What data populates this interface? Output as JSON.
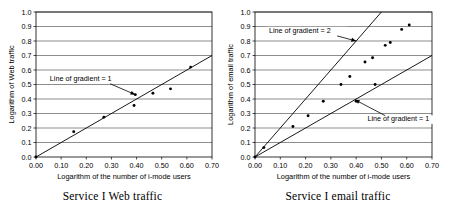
{
  "figure": {
    "panels": [
      {
        "id": "left",
        "caption": "Service I Web traffic",
        "chart_data": {
          "type": "scatter",
          "title": "Service I Web traffic",
          "xlabel": "Logarithm of the number of i-mode users",
          "ylabel": "Logarithm of Web traffic",
          "xlim": [
            0.0,
            0.7
          ],
          "ylim": [
            0.0,
            1.0
          ],
          "xticks": [
            "0.00",
            "0.10",
            "0.20",
            "0.30",
            "0.40",
            "0.50",
            "0.60",
            "0.70"
          ],
          "xtick_values": [
            0.0,
            0.1,
            0.2,
            0.3,
            0.4,
            0.5,
            0.6,
            0.7
          ],
          "yticks": [
            "0.0",
            "0.1",
            "0.2",
            "0.3",
            "0.4",
            "0.5",
            "0.6",
            "0.7",
            "0.8",
            "0.9",
            "1.0"
          ],
          "ytick_values": [
            0.0,
            0.1,
            0.2,
            0.3,
            0.4,
            0.5,
            0.6,
            0.7,
            0.8,
            0.9,
            1.0
          ],
          "grid": "horizontal",
          "legend": "none",
          "points": [
            {
              "x": 0.0,
              "y": 0.0
            },
            {
              "x": 0.15,
              "y": 0.175
            },
            {
              "x": 0.27,
              "y": 0.275
            },
            {
              "x": 0.39,
              "y": 0.355
            },
            {
              "x": 0.395,
              "y": 0.43
            },
            {
              "x": 0.465,
              "y": 0.44
            },
            {
              "x": 0.535,
              "y": 0.47
            },
            {
              "x": 0.615,
              "y": 0.62
            }
          ],
          "lines": [
            {
              "name": "Line of gradient = 1",
              "gradient": 1,
              "from": [
                0.0,
                0.0
              ],
              "to": [
                0.7,
                0.7
              ]
            }
          ],
          "annotations": [
            {
              "text": "Line of gradient = 1",
              "points_to": [
                0.395,
                0.43
              ]
            }
          ]
        }
      },
      {
        "id": "right",
        "caption": "Service I email traffic",
        "chart_data": {
          "type": "scatter",
          "title": "Service I email traffic",
          "xlabel": "Logarithm of the number of i-mode users",
          "ylabel": "Logarithm of email traffic",
          "xlim": [
            0.0,
            0.7
          ],
          "ylim": [
            0.0,
            1.0
          ],
          "xticks": [
            "0.00",
            "0.10",
            "0.20",
            "0.30",
            "0.40",
            "0.50",
            "0.60",
            "0.70"
          ],
          "xtick_values": [
            0.0,
            0.1,
            0.2,
            0.3,
            0.4,
            0.5,
            0.6,
            0.7
          ],
          "yticks": [
            "0.0",
            "0.1",
            "0.2",
            "0.3",
            "0.4",
            "0.5",
            "0.6",
            "0.7",
            "0.8",
            "0.9",
            "1.0"
          ],
          "ytick_values": [
            0.0,
            0.1,
            0.2,
            0.3,
            0.4,
            0.5,
            0.6,
            0.7,
            0.8,
            0.9,
            1.0
          ],
          "grid": "horizontal",
          "legend": "none",
          "points": [
            {
              "x": 0.0,
              "y": 0.0
            },
            {
              "x": 0.035,
              "y": 0.065
            },
            {
              "x": 0.15,
              "y": 0.21
            },
            {
              "x": 0.21,
              "y": 0.285
            },
            {
              "x": 0.27,
              "y": 0.385
            },
            {
              "x": 0.34,
              "y": 0.5
            },
            {
              "x": 0.375,
              "y": 0.555
            },
            {
              "x": 0.4,
              "y": 0.385
            },
            {
              "x": 0.435,
              "y": 0.655
            },
            {
              "x": 0.465,
              "y": 0.685
            },
            {
              "x": 0.475,
              "y": 0.5
            },
            {
              "x": 0.515,
              "y": 0.77
            },
            {
              "x": 0.535,
              "y": 0.79
            },
            {
              "x": 0.58,
              "y": 0.88
            },
            {
              "x": 0.61,
              "y": 0.91
            }
          ],
          "lines": [
            {
              "name": "Line of gradient = 2",
              "gradient": 2,
              "from": [
                0.0,
                0.0
              ],
              "to": [
                0.5,
                1.0
              ]
            },
            {
              "name": "Line of gradient = 1",
              "gradient": 1,
              "from": [
                0.0,
                0.0
              ],
              "to": [
                0.7,
                0.7
              ]
            }
          ],
          "annotations": [
            {
              "text": "Line of gradient = 2",
              "points_to": [
                0.4,
                0.8
              ]
            },
            {
              "text": "Line of gradient = 1",
              "points_to": [
                0.395,
                0.395
              ]
            }
          ]
        }
      }
    ]
  }
}
